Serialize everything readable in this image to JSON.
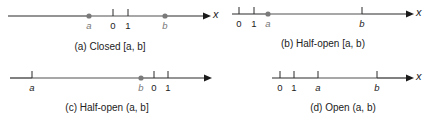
{
  "figure": {
    "axis_variable": "x",
    "colors": {
      "axis_line": "#2a2a2a",
      "interval_line": "#8a8a8a",
      "endpoint_dot": "#7a7a7a",
      "tick": "#2a2a2a",
      "endpoint_label_included": "#777777",
      "label": "#222222"
    },
    "panels": [
      {
        "id": "a",
        "caption": "(a) Closed [a, b]",
        "type": "closed",
        "left_included": true,
        "right_included": true,
        "labels": {
          "a": "a",
          "zero": "0",
          "one": "1",
          "b": "b",
          "x": "x"
        }
      },
      {
        "id": "b",
        "caption": "(b) Half-open [a, b)",
        "type": "half-open-right",
        "left_included": true,
        "right_included": false,
        "labels": {
          "a": "a",
          "zero": "0",
          "one": "1",
          "b": "b",
          "x": "x"
        }
      },
      {
        "id": "c",
        "caption": "(c) Half-open (a, b]",
        "type": "half-open-left",
        "left_included": false,
        "right_included": true,
        "labels": {
          "a": "a",
          "zero": "0",
          "one": "1",
          "b": "b",
          "x": "x"
        }
      },
      {
        "id": "d",
        "caption": "(d) Open (a, b)",
        "type": "open",
        "left_included": false,
        "right_included": false,
        "labels": {
          "a": "a",
          "zero": "0",
          "one": "1",
          "b": "b",
          "x": "x"
        }
      }
    ]
  }
}
